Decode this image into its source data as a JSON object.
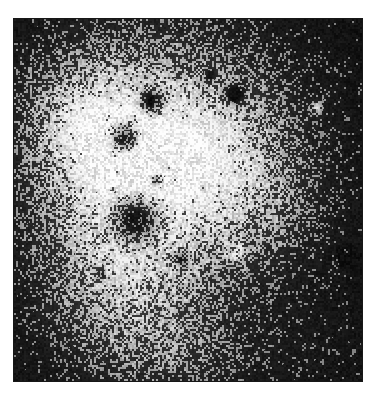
{
  "page": {
    "background_color": "#ffffff",
    "width": 378,
    "height": 400
  },
  "cropped_text_above": {
    "visible_fragment": "",
    "note": "partial descenders of a text line cropped at the top edge",
    "color": "#f0f0f2"
  },
  "figure": {
    "caption": "",
    "kind": "autoradiograph-grain-micrograph",
    "border_color": "#171717",
    "panel": {
      "x": 13,
      "y": 18,
      "width": 350,
      "height": 364
    }
  },
  "chart_data": {
    "type": "heatmap",
    "title": "",
    "subtitle": "",
    "xlabel": "",
    "ylabel": "",
    "grid": false,
    "legend": null,
    "colormap": "grayscale",
    "value_range": [
      0,
      255
    ],
    "render": {
      "width": 348,
      "height": 362,
      "grain_cell": 2,
      "grain_amplitude": 120,
      "seed": 20240511,
      "base_level": 18,
      "gamma": 1.0
    },
    "background_field": {
      "description": "dark vignette at corners, diffuse bright emulsion cloud left-of-center",
      "corner_level": 8,
      "peak_level": 205
    },
    "bright_blobs": [
      {
        "cx": 150,
        "cy": 120,
        "rx": 150,
        "ry": 150,
        "amp": 150,
        "label": "main-emulsion-cloud"
      },
      {
        "cx": 95,
        "cy": 185,
        "rx": 95,
        "ry": 140,
        "amp": 120,
        "label": "left-lobe"
      },
      {
        "cx": 120,
        "cy": 300,
        "rx": 110,
        "ry": 95,
        "amp": 105,
        "label": "lower-left-lobe"
      },
      {
        "cx": 215,
        "cy": 130,
        "rx": 95,
        "ry": 90,
        "amp": 85,
        "label": "upper-right-lobe"
      },
      {
        "cx": 250,
        "cy": 200,
        "rx": 80,
        "ry": 70,
        "amp": 60,
        "label": "mid-right-haze"
      },
      {
        "cx": 60,
        "cy": 95,
        "rx": 70,
        "ry": 70,
        "amp": 95,
        "label": "upper-left-lobe"
      },
      {
        "cx": 300,
        "cy": 330,
        "rx": 85,
        "ry": 60,
        "amp": 45,
        "label": "lower-right-haze"
      },
      {
        "cx": 175,
        "cy": 345,
        "rx": 80,
        "ry": 50,
        "amp": 55,
        "label": "bottom-haze"
      }
    ],
    "dark_spots": [
      {
        "cx": 137,
        "cy": 82,
        "r": 13,
        "depth": 235,
        "label": "spot-a"
      },
      {
        "cx": 110,
        "cy": 118,
        "r": 16,
        "depth": 240,
        "label": "spot-b"
      },
      {
        "cx": 220,
        "cy": 75,
        "r": 11,
        "depth": 215,
        "label": "spot-c"
      },
      {
        "cx": 121,
        "cy": 200,
        "r": 26,
        "depth": 248,
        "label": "spot-d-large-grain"
      },
      {
        "cx": 142,
        "cy": 160,
        "r": 8,
        "depth": 150,
        "label": "spot-e"
      },
      {
        "cx": 167,
        "cy": 240,
        "r": 9,
        "depth": 140,
        "label": "spot-f"
      },
      {
        "cx": 332,
        "cy": 236,
        "r": 9,
        "depth": 150,
        "label": "spot-g-edge"
      },
      {
        "cx": 196,
        "cy": 56,
        "r": 7,
        "depth": 120,
        "label": "spot-h"
      },
      {
        "cx": 88,
        "cy": 255,
        "r": 6,
        "depth": 110,
        "label": "spot-i"
      }
    ],
    "light_spots": [
      {
        "cx": 223,
        "cy": 233,
        "r": 11,
        "level": 215,
        "label": "bright-grain-clear-spot"
      },
      {
        "cx": 302,
        "cy": 88,
        "r": 7,
        "level": 170,
        "label": "bright-spot-upper-right"
      }
    ]
  }
}
